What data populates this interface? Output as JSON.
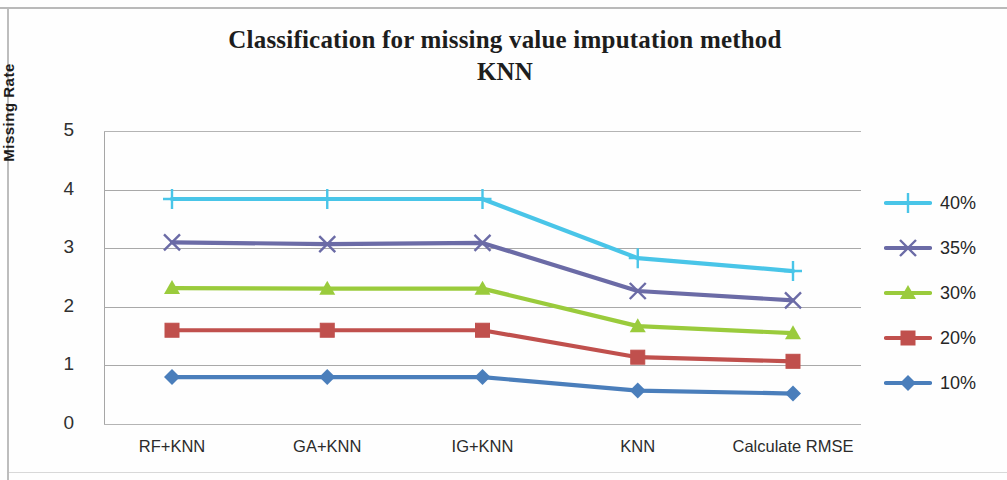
{
  "chart_data": {
    "type": "line",
    "title": "Classification for missing value imputation method KNN",
    "title_line1": "Classification for missing value imputation method",
    "title_line2": "KNN",
    "xlabel": "",
    "ylabel": "Missing Rate",
    "categories": [
      "RF+KNN",
      "GA+KNN",
      "IG+KNN",
      "KNN",
      "Calculate RMSE"
    ],
    "ylim": [
      0,
      5
    ],
    "y_ticks": [
      5,
      4,
      3,
      2,
      1,
      0
    ],
    "grid": true,
    "legend_position": "right",
    "series": [
      {
        "name": "40%",
        "color": "#49C5E8",
        "marker": "plus",
        "values": [
          3.84,
          3.84,
          3.84,
          2.83,
          2.61
        ]
      },
      {
        "name": "35%",
        "color": "#6B6BA6",
        "marker": "cross",
        "values": [
          3.1,
          3.07,
          3.09,
          2.27,
          2.11
        ]
      },
      {
        "name": "30%",
        "color": "#9ACB3C",
        "marker": "triangle",
        "values": [
          2.32,
          2.31,
          2.31,
          1.67,
          1.55
        ]
      },
      {
        "name": "20%",
        "color": "#C0504D",
        "marker": "square",
        "values": [
          1.6,
          1.6,
          1.6,
          1.14,
          1.07
        ]
      },
      {
        "name": "10%",
        "color": "#4A7EBB",
        "marker": "diamond",
        "values": [
          0.8,
          0.8,
          0.8,
          0.57,
          0.52
        ]
      }
    ]
  },
  "legend": {
    "items": [
      {
        "label": "40%",
        "color": "#49C5E8",
        "marker": "plus"
      },
      {
        "label": "35%",
        "color": "#6B6BA6",
        "marker": "cross"
      },
      {
        "label": "30%",
        "color": "#9ACB3C",
        "marker": "triangle"
      },
      {
        "label": "20%",
        "color": "#C0504D",
        "marker": "square"
      },
      {
        "label": "10%",
        "color": "#4A7EBB",
        "marker": "diamond"
      }
    ]
  }
}
